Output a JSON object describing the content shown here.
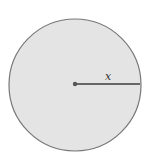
{
  "diagram": {
    "type": "circle-radius",
    "circle": {
      "cx": 75,
      "cy": 85,
      "r": 66,
      "fill": "#e4e4e4",
      "stroke": "#777777"
    },
    "center_point": {
      "cx": 75,
      "cy": 84,
      "r": 2.2,
      "fill": "#555555"
    },
    "radius_line": {
      "x1": 75,
      "y1": 84,
      "x2": 140,
      "y2": 84,
      "stroke": "#666666"
    },
    "radius_label": {
      "text": "x",
      "x": 108,
      "y": 80
    }
  }
}
